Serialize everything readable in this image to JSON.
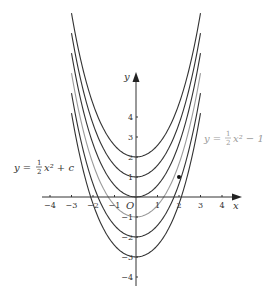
{
  "figure": {
    "axes": {
      "x_label": "x",
      "y_label": "y",
      "origin_label": "O",
      "x_ticks": [
        "-4",
        "-3",
        "-2",
        "-1",
        "1",
        "2",
        "3",
        "4"
      ],
      "x_tick_values": [
        -4,
        -3,
        -2,
        -1,
        1,
        2,
        3,
        4
      ],
      "y_ticks": [
        "4",
        "3",
        "2",
        "1",
        "-1",
        "-2",
        "-3",
        "-4"
      ],
      "y_tick_values": [
        4,
        3,
        2,
        1,
        -1,
        -2,
        -3,
        -4
      ]
    },
    "family_label": {
      "lhs": "y = ",
      "num": "1",
      "den": "2",
      "rhs": "x² + c"
    },
    "highlight_label": {
      "lhs": "y = ",
      "num": "1",
      "den": "2",
      "rhs": "x² − 1"
    },
    "colors": {
      "curve": "#333333",
      "highlight_curve": "#9a9a9a",
      "axis": "#333333"
    }
  },
  "chart_data": {
    "type": "line",
    "xlabel": "x",
    "ylabel": "y",
    "xlim": [
      -4.5,
      4.8
    ],
    "ylim": [
      -4.5,
      8.5
    ],
    "grid": false,
    "x_domain": [
      -3,
      3
    ],
    "series": [
      {
        "name": "c = 2",
        "c": 2,
        "highlight": false
      },
      {
        "name": "c = 1",
        "c": 1,
        "highlight": false
      },
      {
        "name": "c = 0",
        "c": 0,
        "highlight": false
      },
      {
        "name": "c = -1 (y = 1/2 x^2 - 1)",
        "c": -1,
        "highlight": true
      },
      {
        "name": "c = -2",
        "c": -2,
        "highlight": false
      },
      {
        "name": "c = -3",
        "c": -3,
        "highlight": false
      }
    ],
    "points": [
      {
        "x": 2,
        "y": 1,
        "label": "point on y = 1/2 x^2 - 1"
      }
    ],
    "annotations": [
      "y = 1/2 x^2 + c",
      "y = 1/2 x^2 - 1"
    ]
  }
}
